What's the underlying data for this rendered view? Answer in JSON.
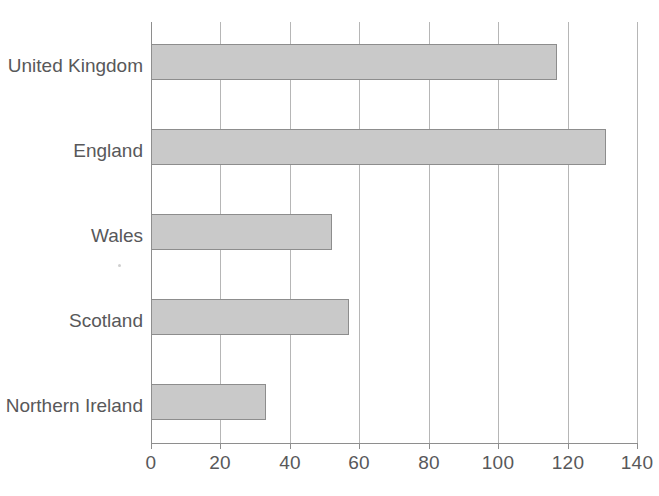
{
  "chart_data": {
    "type": "bar",
    "orientation": "horizontal",
    "title": "",
    "subtitle": "",
    "xlabel": "",
    "ylabel": "",
    "categories": [
      "United Kingdom",
      "England",
      "Wales",
      "Scotland",
      "Northern Ireland"
    ],
    "values": [
      117,
      131,
      52,
      57,
      33
    ],
    "series": [
      {
        "name": "",
        "values": [
          117,
          131,
          52,
          57,
          33
        ]
      }
    ],
    "xlim": [
      0,
      140
    ],
    "ylim": null,
    "xticks": [
      0,
      20,
      40,
      60,
      80,
      100,
      120,
      140
    ],
    "xtick_labels": [
      "0",
      "20",
      "40",
      "60",
      "80",
      "100",
      "120",
      "140"
    ],
    "grid": "vertical",
    "legend": "none",
    "annotations": [],
    "colors": {
      "bar_fill": "#c9c9c9",
      "bar_stroke": "#8d8d8d",
      "gridline": "#b6b6b6",
      "axis": "#8e8e8e",
      "text": "#58585a",
      "background": "#ffffff"
    }
  },
  "axis": {
    "tick_labels": [
      "0",
      "20",
      "40",
      "60",
      "80",
      "100",
      "120",
      "140"
    ]
  },
  "categories": {
    "labels": [
      "United Kingdom",
      "England",
      "Wales",
      "Scotland",
      "Northern Ireland"
    ]
  }
}
